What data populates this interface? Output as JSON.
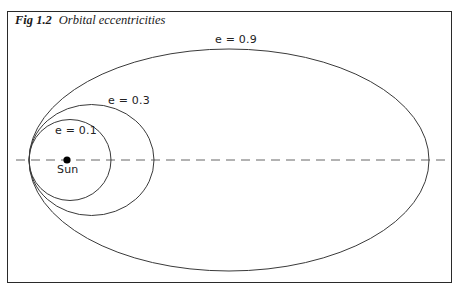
{
  "figure": {
    "number": "Fig 1.2",
    "title": "Orbital eccentricities"
  },
  "labels": {
    "sun": "Sun",
    "orbits": [
      {
        "e": 0.1,
        "label": "e = 0.1"
      },
      {
        "e": 0.3,
        "label": "e = 0.3"
      },
      {
        "e": 0.9,
        "label": "e = 0.9"
      }
    ]
  },
  "diagram": {
    "focus": "Sun",
    "axis": "major axis (dashed)",
    "orbit_count": 3,
    "shared_perihelion": true
  },
  "colors": {
    "stroke": "#3a3a3a",
    "axis": "#555555",
    "sun": "#000000",
    "background": "#ffffff"
  }
}
